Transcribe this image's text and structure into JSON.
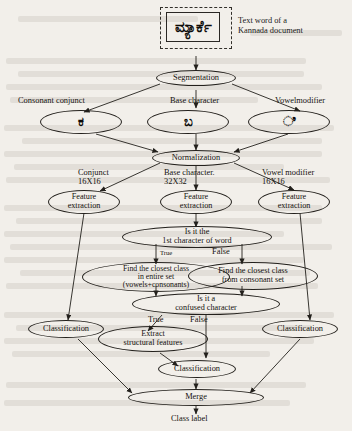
{
  "diagram": {
    "input": {
      "word_text": "ಮ್ಯಾರ್ಕೆ",
      "caption": "Text word of a\nKannada document"
    },
    "nodes": {
      "segmentation": "Segmentation",
      "normalization": "Normalization",
      "feature_extraction_left": "Feature\nextraction",
      "feature_extraction_center": "Feature\nextraction",
      "feature_extraction_right": "Feature\nextraction",
      "is_first_char": "Is it the\n1st character of word",
      "find_closest_all": "Find the closest class\nin entire set\n(vowels+consonants)",
      "find_closest_consonant": "Find the closest class\nfrom consonant set",
      "is_confused": "Is it a\nconfused character",
      "extract_structural": "Extract\nstructural features",
      "classification_left": "Classification",
      "classification_center": "Classification",
      "classification_right": "Classification",
      "merge": "Merge"
    },
    "segments": {
      "consonant_conjunct_label": "Consonant conjunct",
      "base_character_label": "Base character",
      "vowel_modifier_label": "Vowelmodifier",
      "consonant_conjunct_glyph": "ಕ",
      "base_character_glyph": "ಬ",
      "vowel_modifier_glyph": "ಿ"
    },
    "normalization_outputs": {
      "conjunct": "Conjunct\n16X16",
      "base": "Base character.\n32X32",
      "vowel": "Vowel modifier\n16X16"
    },
    "branch_labels": {
      "first_char_true": "True",
      "first_char_false": "False",
      "confused_true": "True",
      "confused_false": "False"
    },
    "output": {
      "class_label": "Class label"
    },
    "colors": {
      "page_background": "#f2efea",
      "ink": "#15120f",
      "stroke": "#23201c"
    }
  }
}
